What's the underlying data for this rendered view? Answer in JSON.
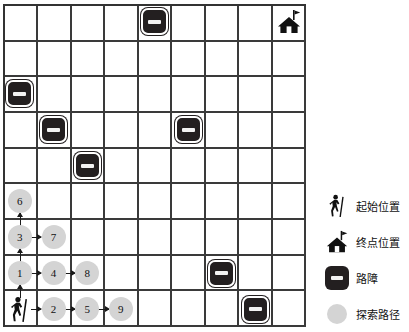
{
  "grid": {
    "rows": 9,
    "cols": 9,
    "line_color": "#3a3a3a",
    "cell_background": "#ffffff"
  },
  "colors": {
    "obstacle": "#231f20",
    "path_node": "#d4d4d4",
    "arrow": "#1a1a1a",
    "text": "#111111"
  },
  "start": {
    "icon": "hiker-icon",
    "row": 8,
    "col": 0
  },
  "end": {
    "icon": "house-flag-icon",
    "row": 0,
    "col": 8
  },
  "obstacles": [
    {
      "icon": "obstacle-icon",
      "row": 0,
      "col": 4
    },
    {
      "icon": "obstacle-icon",
      "row": 2,
      "col": 0
    },
    {
      "icon": "obstacle-icon",
      "row": 3,
      "col": 1
    },
    {
      "icon": "obstacle-icon",
      "row": 3,
      "col": 5
    },
    {
      "icon": "obstacle-icon",
      "row": 4,
      "col": 2
    },
    {
      "icon": "obstacle-icon",
      "row": 7,
      "col": 6
    },
    {
      "icon": "obstacle-icon",
      "row": 8,
      "col": 7
    }
  ],
  "path_nodes": [
    {
      "label": "1",
      "row": 7,
      "col": 0
    },
    {
      "label": "2",
      "row": 8,
      "col": 1
    },
    {
      "label": "3",
      "row": 6,
      "col": 0
    },
    {
      "label": "4",
      "row": 7,
      "col": 1
    },
    {
      "label": "5",
      "row": 8,
      "col": 2
    },
    {
      "label": "6",
      "row": 5,
      "col": 0
    },
    {
      "label": "7",
      "row": 6,
      "col": 1
    },
    {
      "label": "8",
      "row": 7,
      "col": 2
    },
    {
      "label": "9",
      "row": 8,
      "col": 3
    }
  ],
  "arrows": [
    {
      "from": {
        "row": 8,
        "col": 0
      },
      "to": {
        "row": 7,
        "col": 0
      },
      "dir": "up"
    },
    {
      "from": {
        "row": 7,
        "col": 0
      },
      "to": {
        "row": 6,
        "col": 0
      },
      "dir": "up"
    },
    {
      "from": {
        "row": 6,
        "col": 0
      },
      "to": {
        "row": 5,
        "col": 0
      },
      "dir": "up"
    },
    {
      "from": {
        "row": 8,
        "col": 0
      },
      "to": {
        "row": 8,
        "col": 1
      },
      "dir": "right"
    },
    {
      "from": {
        "row": 8,
        "col": 1
      },
      "to": {
        "row": 8,
        "col": 2
      },
      "dir": "right"
    },
    {
      "from": {
        "row": 8,
        "col": 2
      },
      "to": {
        "row": 8,
        "col": 3
      },
      "dir": "right"
    },
    {
      "from": {
        "row": 7,
        "col": 0
      },
      "to": {
        "row": 7,
        "col": 1
      },
      "dir": "right"
    },
    {
      "from": {
        "row": 7,
        "col": 1
      },
      "to": {
        "row": 7,
        "col": 2
      },
      "dir": "right"
    },
    {
      "from": {
        "row": 6,
        "col": 0
      },
      "to": {
        "row": 6,
        "col": 1
      },
      "dir": "right"
    }
  ],
  "legend": {
    "items": [
      {
        "icon": "hiker-icon",
        "label": "起始位置"
      },
      {
        "icon": "house-flag-icon",
        "label": "终点位置"
      },
      {
        "icon": "obstacle-icon",
        "label": "路障"
      },
      {
        "icon": "path-dot-icon",
        "label": "探索路径"
      }
    ]
  }
}
